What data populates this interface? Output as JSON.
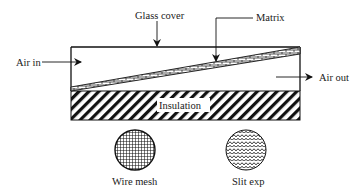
{
  "diagram": {
    "labels": {
      "glass_cover": "Glass cover",
      "matrix": "Matrix",
      "air_in": "Air in",
      "air_out": "Air out",
      "insulation": "Insulation",
      "wire_mesh": "Wire mesh",
      "slit_exp": "Slit exp"
    },
    "colors": {
      "line": "#111111",
      "background": "#ffffff"
    }
  }
}
